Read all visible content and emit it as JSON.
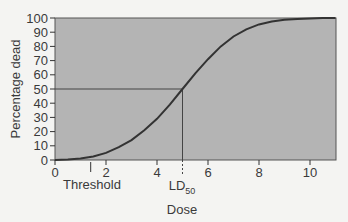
{
  "chart_data": {
    "type": "line",
    "title": "",
    "xlabel": "Dose",
    "ylabel": "Percentage dead",
    "xlim": [
      0,
      11
    ],
    "ylim": [
      0,
      100
    ],
    "x_ticks": [
      0,
      2,
      4,
      6,
      8,
      10
    ],
    "y_ticks": [
      0,
      10,
      20,
      30,
      40,
      50,
      60,
      70,
      80,
      90,
      100
    ],
    "grid": false,
    "legend": null,
    "series": [
      {
        "name": "Dose-response curve",
        "x": [
          0,
          0.5,
          1,
          1.5,
          2,
          2.5,
          3,
          3.5,
          4,
          4.5,
          5,
          5.5,
          6,
          6.5,
          7,
          7.5,
          8,
          8.5,
          9,
          9.5,
          10,
          10.5,
          11
        ],
        "values": [
          0,
          0.3,
          1,
          2.5,
          5,
          9,
          14,
          21,
          29,
          39,
          50,
          61,
          71,
          80,
          87,
          92,
          95.5,
          97.5,
          98.7,
          99.3,
          99.7,
          99.9,
          100
        ]
      }
    ],
    "annotations": [
      {
        "label": "Threshold",
        "x": 1.4,
        "type": "tick-marker"
      },
      {
        "label": "LD",
        "subscript": "50",
        "x": 5.0,
        "y": 50,
        "type": "reference-lines"
      }
    ],
    "colors": {
      "plot_background": "#b4b4b4",
      "curve": "#333333",
      "page_background": "#f4f4f2"
    }
  },
  "labels": {
    "xlabel": "Dose",
    "ylabel": "Percentage dead",
    "threshold": "Threshold",
    "ld": "LD",
    "ld_sub": "50"
  }
}
